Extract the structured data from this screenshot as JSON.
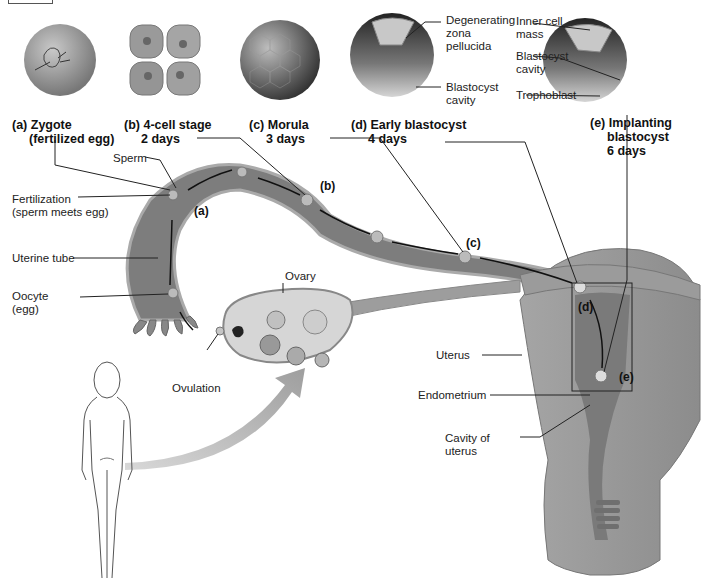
{
  "stages": [
    {
      "id": "a",
      "title": "(a) Zygote",
      "subtitle": "(fertilized egg)"
    },
    {
      "id": "b",
      "title": "(b) 4-cell stage",
      "subtitle": "2 days"
    },
    {
      "id": "c",
      "title": "(c) Morula",
      "subtitle": "3 days"
    },
    {
      "id": "d",
      "title": "(d) Early blastocyst",
      "subtitle": "4 days"
    },
    {
      "id": "e",
      "title": "(e) Implanting",
      "subtitle": "blastocyst",
      "subtitle2": "6 days"
    }
  ],
  "blastocyst_labels": {
    "degenerating": [
      "Degenerating",
      "zona",
      "pellucida"
    ],
    "cavity_d": [
      "Blastocyst",
      "cavity"
    ],
    "inner_cell": [
      "Inner cell",
      "mass"
    ],
    "cavity_e": [
      "Blastocyst",
      "cavity"
    ],
    "trophoblast": "Trophoblast"
  },
  "anatomy_labels": {
    "sperm": "Sperm",
    "fertilization": [
      "Fertilization",
      "(sperm meets egg)"
    ],
    "uterine_tube": "Uterine tube",
    "oocyte": [
      "Oocyte",
      "(egg)"
    ],
    "ovary": "Ovary",
    "ovulation": "Ovulation",
    "uterus": "Uterus",
    "endometrium": "Endometrium",
    "cavity_uterus": [
      "Cavity of",
      "uterus"
    ]
  },
  "path_markers": [
    "(a)",
    "(b)",
    "(c)",
    "(d)",
    "(e)"
  ],
  "colors": {
    "tissue": "#8a8a8a",
    "tissue_dark": "#6e6e6e",
    "tissue_light": "#b5b5b5",
    "line": "#222222"
  }
}
